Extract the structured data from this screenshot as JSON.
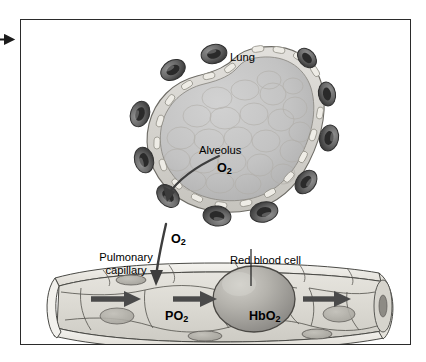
{
  "figure": {
    "frame_color": "#2b2b2b",
    "background": "#ffffff"
  },
  "labels": {
    "lung": "Lung",
    "alveolus": "Alveolus",
    "o2_alveolus": "O",
    "o2_alveolus_sub": "2",
    "o2_gap": "O",
    "o2_gap_sub": "2",
    "pulmonary_capillary_line1": "Pulmonary",
    "pulmonary_capillary_line2": "capillary",
    "red_blood_cell": "Red blood cell",
    "po2": "PO",
    "po2_sub": "2",
    "hbo2": "HbO",
    "hbo2_sub": "2"
  },
  "icons": {
    "page_marker": "right-arrow-marker",
    "diffusion_arrow_alveolus": "curved-arrow-down-left",
    "diffusion_arrow_capillary": "curved-arrow-down",
    "blood_flow_arrow": "right-arrow-thick",
    "leader_line_rbc": "leader-line-vertical"
  },
  "colors": {
    "alveolus_fill": "#c4c4c4",
    "alveolus_rim": "#d8d8d4",
    "capillary_cross_section": "#5a5a5a",
    "capillary_wall": "#eceae4",
    "capillary_lumen": "#d6d4ce",
    "red_blood_cell": "#a8a6a0",
    "outline": "#3a3a3a",
    "arrow": "#4a4a4a",
    "text": "#000000"
  },
  "structures": {
    "alveolus_capillary_count": 11,
    "blood_flow_arrow_count": 3,
    "endothelial_nuclei_count": 4
  }
}
